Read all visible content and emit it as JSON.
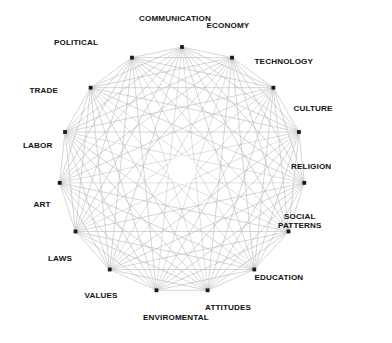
{
  "diagram": {
    "type": "circular-network",
    "title": "",
    "background_color": "#ffffff",
    "node_color": "#1a1a1a",
    "edge_color": "#a8a8a8",
    "label_color": "#111111",
    "node_count": 15,
    "center": {
      "x": 182,
      "y": 170
    },
    "radius": 123,
    "inner_gap_radius": 14,
    "fully_connected": true,
    "nodes": [
      {
        "id": "communication",
        "label": "COMMUNICATION",
        "angle_deg": -90,
        "label_pos": "top",
        "label_x": 175,
        "label_y": 18
      },
      {
        "id": "economy",
        "label": "ECONOMY",
        "angle_deg": -66,
        "label_pos": "top-right",
        "label_x": 228,
        "label_y": 25
      },
      {
        "id": "technology",
        "label": "TECHNOLOGY",
        "angle_deg": -42,
        "label_pos": "right",
        "label_x": 284,
        "label_y": 61
      },
      {
        "id": "culture",
        "label": "CULTURE",
        "angle_deg": -18,
        "label_pos": "right",
        "label_x": 313,
        "label_y": 108
      },
      {
        "id": "religion",
        "label": "RELIGION",
        "angle_deg": 6,
        "label_pos": "right",
        "label_x": 311,
        "label_y": 166
      },
      {
        "id": "social-patterns",
        "label": "SOCIAL\nPATTERNS",
        "angle_deg": 30,
        "label_pos": "right",
        "label_x": 300,
        "label_y": 221
      },
      {
        "id": "education",
        "label": "EDUCATION",
        "angle_deg": 54,
        "label_pos": "right",
        "label_x": 279,
        "label_y": 277
      },
      {
        "id": "attitudes",
        "label": "ATTITUDES",
        "angle_deg": 78,
        "label_pos": "bottom-right",
        "label_x": 228,
        "label_y": 307
      },
      {
        "id": "enviromental",
        "label": "ENVIROMENTAL",
        "angle_deg": 102,
        "label_pos": "bottom",
        "label_x": 176,
        "label_y": 317
      },
      {
        "id": "values",
        "label": "VALUES",
        "angle_deg": 126,
        "label_pos": "bottom-left",
        "label_x": 101,
        "label_y": 295
      },
      {
        "id": "laws",
        "label": "LAWS",
        "angle_deg": 150,
        "label_pos": "left",
        "label_x": 60,
        "label_y": 258
      },
      {
        "id": "art",
        "label": "ART",
        "angle_deg": 174,
        "label_pos": "left",
        "label_x": 42,
        "label_y": 204
      },
      {
        "id": "labor",
        "label": "LABOR",
        "angle_deg": 198,
        "label_pos": "left",
        "label_x": 38,
        "label_y": 145
      },
      {
        "id": "trade",
        "label": "TRADE",
        "angle_deg": 222,
        "label_pos": "left",
        "label_x": 44,
        "label_y": 90
      },
      {
        "id": "political",
        "label": "POLITICAL",
        "angle_deg": 246,
        "label_pos": "top-left",
        "label_x": 76,
        "label_y": 42
      }
    ]
  }
}
